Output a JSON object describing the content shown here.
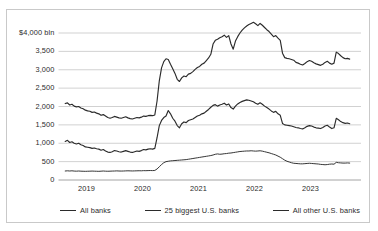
{
  "chart_data": {
    "type": "line",
    "title": "",
    "subtitle": "",
    "xlabel": "",
    "ylabel": "",
    "unit_label": "$4,000 bln",
    "ylim": [
      0,
      4500
    ],
    "xlim": [
      2018.6,
      2023.75
    ],
    "grid": true,
    "grid_axis": "y",
    "legend_position": "bottom",
    "ytick_labels": [
      "$4,000 bln",
      "3,500",
      "3,000",
      "2,500",
      "2,000",
      "1,500",
      "1,000",
      "500",
      "0"
    ],
    "ytick_values": [
      4000,
      3500,
      3000,
      2500,
      2000,
      1500,
      1000,
      500,
      0
    ],
    "xtick_labels": [
      "2019",
      "2020",
      "2021",
      "2022",
      "2023"
    ],
    "xtick_values": [
      2019,
      2020,
      2021,
      2022,
      2023
    ],
    "line_color": "#2b2b2b",
    "grid_color": "#bdbdbd",
    "series": [
      {
        "name": "All banks",
        "color": "#2b2b2b",
        "x": [
          2018.62,
          2018.66,
          2018.7,
          2018.74,
          2018.78,
          2018.82,
          2018.86,
          2018.9,
          2018.94,
          2018.98,
          2019.02,
          2019.06,
          2019.1,
          2019.14,
          2019.18,
          2019.22,
          2019.26,
          2019.3,
          2019.34,
          2019.38,
          2019.42,
          2019.46,
          2019.5,
          2019.54,
          2019.58,
          2019.62,
          2019.66,
          2019.7,
          2019.74,
          2019.78,
          2019.82,
          2019.86,
          2019.9,
          2019.94,
          2019.98,
          2020.02,
          2020.06,
          2020.1,
          2020.14,
          2020.18,
          2020.22,
          2020.26,
          2020.3,
          2020.34,
          2020.38,
          2020.42,
          2020.46,
          2020.5,
          2020.54,
          2020.58,
          2020.62,
          2020.66,
          2020.7,
          2020.74,
          2020.78,
          2020.82,
          2020.86,
          2020.9,
          2020.94,
          2020.98,
          2021.02,
          2021.06,
          2021.1,
          2021.14,
          2021.18,
          2021.22,
          2021.26,
          2021.3,
          2021.34,
          2021.38,
          2021.42,
          2021.46,
          2021.5,
          2021.54,
          2021.58,
          2021.62,
          2021.66,
          2021.7,
          2021.74,
          2021.78,
          2021.82,
          2021.86,
          2021.9,
          2021.94,
          2021.98,
          2022.02,
          2022.06,
          2022.1,
          2022.14,
          2022.18,
          2022.22,
          2022.26,
          2022.3,
          2022.34,
          2022.38,
          2022.42,
          2022.46,
          2022.5,
          2022.54,
          2022.58,
          2022.62,
          2022.66,
          2022.7,
          2022.74,
          2022.78,
          2022.82,
          2022.86,
          2022.9,
          2022.94,
          2022.98,
          2023.02,
          2023.06,
          2023.1,
          2023.14,
          2023.18,
          2023.22,
          2023.26,
          2023.3,
          2023.34,
          2023.38,
          2023.42,
          2023.46,
          2023.5,
          2023.54,
          2023.58,
          2023.62,
          2023.66,
          2023.7
        ],
        "values": [
          2080,
          2100,
          2040,
          2060,
          2010,
          1990,
          2000,
          1960,
          1940,
          1900,
          1880,
          1870,
          1840,
          1850,
          1820,
          1800,
          1760,
          1780,
          1740,
          1700,
          1680,
          1700,
          1730,
          1710,
          1690,
          1680,
          1700,
          1720,
          1690,
          1670,
          1660,
          1680,
          1700,
          1690,
          1710,
          1740,
          1730,
          1750,
          1760,
          1750,
          1770,
          2150,
          2700,
          3050,
          3220,
          3300,
          3280,
          3150,
          3030,
          2900,
          2740,
          2680,
          2780,
          2830,
          2810,
          2880,
          2900,
          2950,
          3010,
          3060,
          3090,
          3150,
          3180,
          3250,
          3320,
          3420,
          3700,
          3800,
          3830,
          3870,
          3900,
          3940,
          3880,
          3930,
          3700,
          3560,
          3780,
          3900,
          4000,
          4080,
          4140,
          4190,
          4230,
          4260,
          4290,
          4250,
          4200,
          4260,
          4210,
          4150,
          4090,
          4040,
          3970,
          3900,
          3930,
          3860,
          3800,
          3450,
          3330,
          3310,
          3300,
          3280,
          3260,
          3200,
          3180,
          3150,
          3130,
          3170,
          3220,
          3250,
          3230,
          3190,
          3160,
          3140,
          3120,
          3150,
          3200,
          3230,
          3180,
          3150,
          3180,
          3480,
          3440,
          3380,
          3330,
          3300,
          3310,
          3290
        ]
      },
      {
        "name": "25 biggest U.S. banks",
        "color": "#2b2b2b",
        "x": [
          2018.62,
          2018.66,
          2018.7,
          2018.74,
          2018.78,
          2018.82,
          2018.86,
          2018.9,
          2018.94,
          2018.98,
          2019.02,
          2019.06,
          2019.1,
          2019.14,
          2019.18,
          2019.22,
          2019.26,
          2019.3,
          2019.34,
          2019.38,
          2019.42,
          2019.46,
          2019.5,
          2019.54,
          2019.58,
          2019.62,
          2019.66,
          2019.7,
          2019.74,
          2019.78,
          2019.82,
          2019.86,
          2019.9,
          2019.94,
          2019.98,
          2020.02,
          2020.06,
          2020.1,
          2020.14,
          2020.18,
          2020.22,
          2020.26,
          2020.3,
          2020.34,
          2020.38,
          2020.42,
          2020.46,
          2020.5,
          2020.54,
          2020.58,
          2020.62,
          2020.66,
          2020.7,
          2020.74,
          2020.78,
          2020.82,
          2020.86,
          2020.9,
          2020.94,
          2020.98,
          2021.02,
          2021.06,
          2021.1,
          2021.14,
          2021.18,
          2021.22,
          2021.26,
          2021.3,
          2021.34,
          2021.38,
          2021.42,
          2021.46,
          2021.5,
          2021.54,
          2021.58,
          2021.62,
          2021.66,
          2021.7,
          2021.74,
          2021.78,
          2021.82,
          2021.86,
          2021.9,
          2021.94,
          2021.98,
          2022.02,
          2022.06,
          2022.1,
          2022.14,
          2022.18,
          2022.22,
          2022.26,
          2022.3,
          2022.34,
          2022.38,
          2022.42,
          2022.46,
          2022.5,
          2022.54,
          2022.58,
          2022.62,
          2022.66,
          2022.7,
          2022.74,
          2022.78,
          2022.82,
          2022.86,
          2022.9,
          2022.94,
          2022.98,
          2023.02,
          2023.06,
          2023.1,
          2023.14,
          2023.18,
          2023.22,
          2023.26,
          2023.3,
          2023.34,
          2023.38,
          2023.42,
          2023.46,
          2023.5,
          2023.54,
          2023.58,
          2023.62,
          2023.66,
          2023.7
        ],
        "values": [
          1050,
          1080,
          1020,
          1040,
          1000,
          980,
          1000,
          960,
          940,
          900,
          890,
          880,
          860,
          870,
          850,
          840,
          810,
          830,
          790,
          760,
          750,
          770,
          800,
          790,
          770,
          760,
          780,
          800,
          780,
          760,
          750,
          770,
          790,
          780,
          800,
          830,
          820,
          840,
          850,
          840,
          860,
          1150,
          1480,
          1620,
          1700,
          1740,
          1890,
          1800,
          1680,
          1600,
          1480,
          1420,
          1530,
          1580,
          1560,
          1620,
          1640,
          1660,
          1700,
          1740,
          1760,
          1800,
          1820,
          1870,
          1920,
          1980,
          2030,
          2050,
          2010,
          2040,
          2060,
          2090,
          2040,
          2070,
          1970,
          1930,
          2010,
          2070,
          2110,
          2140,
          2160,
          2180,
          2170,
          2150,
          2130,
          2090,
          2060,
          2100,
          2060,
          2010,
          1970,
          1930,
          1880,
          1840,
          1870,
          1800,
          1760,
          1540,
          1500,
          1490,
          1480,
          1470,
          1450,
          1430,
          1420,
          1400,
          1390,
          1420,
          1460,
          1480,
          1470,
          1440,
          1420,
          1410,
          1400,
          1430,
          1470,
          1490,
          1440,
          1400,
          1420,
          1680,
          1640,
          1590,
          1560,
          1540,
          1550,
          1530
        ]
      },
      {
        "name": "All other U.S. banks",
        "color": "#2b2b2b",
        "x": [
          2018.62,
          2018.66,
          2018.7,
          2018.74,
          2018.78,
          2018.82,
          2018.86,
          2018.9,
          2018.94,
          2018.98,
          2019.02,
          2019.06,
          2019.1,
          2019.14,
          2019.18,
          2019.22,
          2019.26,
          2019.3,
          2019.34,
          2019.38,
          2019.42,
          2019.46,
          2019.5,
          2019.54,
          2019.58,
          2019.62,
          2019.66,
          2019.7,
          2019.74,
          2019.78,
          2019.82,
          2019.86,
          2019.9,
          2019.94,
          2019.98,
          2020.02,
          2020.06,
          2020.1,
          2020.14,
          2020.18,
          2020.22,
          2020.26,
          2020.3,
          2020.34,
          2020.38,
          2020.42,
          2020.46,
          2020.5,
          2020.54,
          2020.58,
          2020.62,
          2020.66,
          2020.7,
          2020.74,
          2020.78,
          2020.82,
          2020.86,
          2020.9,
          2020.94,
          2020.98,
          2021.02,
          2021.06,
          2021.1,
          2021.14,
          2021.18,
          2021.22,
          2021.26,
          2021.3,
          2021.34,
          2021.38,
          2021.42,
          2021.46,
          2021.5,
          2021.54,
          2021.58,
          2021.62,
          2021.66,
          2021.7,
          2021.74,
          2021.78,
          2021.82,
          2021.86,
          2021.9,
          2021.94,
          2021.98,
          2022.02,
          2022.06,
          2022.1,
          2022.14,
          2022.18,
          2022.22,
          2022.26,
          2022.3,
          2022.34,
          2022.38,
          2022.42,
          2022.46,
          2022.5,
          2022.54,
          2022.58,
          2022.62,
          2022.66,
          2022.7,
          2022.74,
          2022.78,
          2022.82,
          2022.86,
          2022.9,
          2022.94,
          2022.98,
          2023.02,
          2023.06,
          2023.1,
          2023.14,
          2023.18,
          2023.22,
          2023.26,
          2023.3,
          2023.34,
          2023.38,
          2023.42,
          2023.46,
          2023.5,
          2023.54,
          2023.58,
          2023.62,
          2023.66,
          2023.7
        ],
        "values": [
          245,
          250,
          245,
          250,
          243,
          240,
          245,
          240,
          238,
          236,
          238,
          240,
          243,
          240,
          238,
          236,
          240,
          245,
          240,
          238,
          240,
          243,
          245,
          248,
          245,
          243,
          245,
          248,
          250,
          248,
          246,
          248,
          250,
          252,
          250,
          255,
          253,
          256,
          258,
          256,
          260,
          300,
          360,
          420,
          470,
          500,
          510,
          520,
          525,
          530,
          535,
          540,
          545,
          550,
          555,
          565,
          575,
          585,
          595,
          605,
          615,
          625,
          635,
          645,
          655,
          665,
          680,
          700,
          710,
          700,
          705,
          715,
          720,
          730,
          735,
          745,
          755,
          765,
          775,
          780,
          785,
          790,
          790,
          795,
          790,
          785,
          790,
          795,
          785,
          770,
          755,
          740,
          720,
          700,
          680,
          650,
          620,
          580,
          540,
          510,
          490,
          470,
          455,
          450,
          445,
          440,
          440,
          445,
          450,
          455,
          450,
          445,
          440,
          435,
          425,
          420,
          415,
          420,
          430,
          435,
          430,
          480,
          470,
          465,
          460,
          460,
          465,
          460
        ]
      }
    ]
  },
  "axes": {
    "yticks": [
      {
        "label": "$4,000 bln",
        "value": 4000
      },
      {
        "label": "3,500",
        "value": 3500
      },
      {
        "label": "3,000",
        "value": 3000
      },
      {
        "label": "2,500",
        "value": 2500
      },
      {
        "label": "2,000",
        "value": 2000
      },
      {
        "label": "1,500",
        "value": 1500
      },
      {
        "label": "1,000",
        "value": 1000
      },
      {
        "label": "500",
        "value": 500
      },
      {
        "label": "0",
        "value": 0
      }
    ],
    "xticks": [
      {
        "label": "2019",
        "value": 2019
      },
      {
        "label": "2020",
        "value": 2020
      },
      {
        "label": "2021",
        "value": 2021
      },
      {
        "label": "2022",
        "value": 2022
      },
      {
        "label": "2023",
        "value": 2023
      }
    ]
  },
  "legend": {
    "items": [
      {
        "label": "All banks",
        "color": "#2b2b2b"
      },
      {
        "label": "25 biggest U.S. banks",
        "color": "#2b2b2b"
      },
      {
        "label": "All other U.S. banks",
        "color": "#2b2b2b"
      }
    ]
  },
  "colors": {
    "line": "#2b2b2b",
    "grid": "#bdbdbd",
    "border": "#c9c9c9",
    "background": "#ffffff",
    "text": "#2b2b2b"
  }
}
